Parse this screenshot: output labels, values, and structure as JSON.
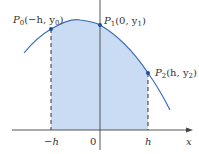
{
  "diagram": {
    "colors": {
      "curve": "#3a6fb5",
      "fill": "#c9dcf3",
      "axis": "#444444",
      "point": "#1f4f96",
      "text": "#333333"
    },
    "points": [
      {
        "name": "P0",
        "label_main": "P",
        "label_sub": "0",
        "label_args": "(−h, y",
        "label_args_sub": "0",
        "label_close": ")"
      },
      {
        "name": "P1",
        "label_main": "P",
        "label_sub": "1",
        "label_args": "(0, y",
        "label_args_sub": "1",
        "label_close": ")"
      },
      {
        "name": "P2",
        "label_main": "P",
        "label_sub": "2",
        "label_args": "(h, y",
        "label_args_sub": "2",
        "label_close": ")"
      }
    ],
    "x_ticks": [
      {
        "label": "−h"
      },
      {
        "label": "0"
      },
      {
        "label": "h"
      }
    ],
    "x_axis_label": "x"
  }
}
